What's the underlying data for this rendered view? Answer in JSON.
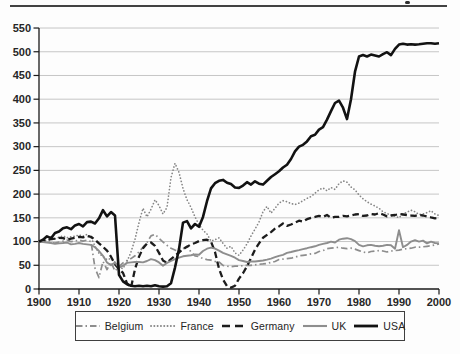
{
  "figure": {
    "page_top_rule": true,
    "header_remnant_mark": true
  },
  "colors": {
    "background": "#fdfdfd",
    "grid": "#c6c6c6",
    "axis": "#1a1a1a",
    "tick_text": "#262626",
    "page_rule": "#424242",
    "legend_border": "#3f3f3f",
    "series_grey": "#8d8d8d",
    "series_black": "#141414"
  },
  "chart_data": {
    "type": "line",
    "title": "",
    "xlabel": "",
    "ylabel": "",
    "xlim": [
      1900,
      2000
    ],
    "ylim": [
      0,
      550
    ],
    "x_tick_labels": [
      "1900",
      "1910",
      "1920",
      "1930",
      "1940",
      "1950",
      "1960",
      "1970",
      "1980",
      "1990",
      "2000"
    ],
    "y_tick_labels": [
      "0",
      "50",
      "100",
      "150",
      "200",
      "250",
      "300",
      "350",
      "400",
      "450",
      "500",
      "550"
    ],
    "grid": "horizontal",
    "legend_position": "bottom-box",
    "x_start_year": 1900,
    "x_step_years": 1,
    "index_base": "1900 = 100",
    "series": [
      {
        "name": "Belgium",
        "color": "#8d8d8d",
        "style": "dashdot",
        "width": 1.7,
        "values": [
          100,
          100,
          99,
          98,
          97,
          99,
          101,
          103,
          100,
          101,
          103,
          101,
          103,
          100,
          44,
          24,
          58,
          41,
          57,
          38,
          47,
          55,
          60,
          64,
          70,
          78,
          88,
          98,
          112,
          115,
          107,
          99,
          92,
          86,
          82,
          80,
          85,
          90,
          78,
          70,
          68,
          64,
          62,
          61,
          58,
          57,
          50,
          48,
          47,
          48,
          48,
          49,
          50,
          50,
          51,
          52,
          53,
          54,
          56,
          58,
          62,
          63,
          64,
          65,
          67,
          70,
          71,
          72,
          74,
          75,
          79,
          81,
          85,
          86,
          87,
          88,
          86,
          85,
          86,
          84,
          81,
          78,
          76,
          79,
          80,
          81,
          80,
          78,
          80,
          81,
          82,
          84,
          85,
          86,
          88,
          88,
          89,
          90,
          91,
          93,
          95
        ]
      },
      {
        "name": "France",
        "color": "#868686",
        "style": "dotted",
        "width": 1.7,
        "values": [
          100,
          102,
          103,
          104,
          106,
          109,
          112,
          108,
          110,
          111,
          114,
          111,
          115,
          109,
          90,
          75,
          68,
          62,
          64,
          56,
          46,
          43,
          58,
          78,
          105,
          140,
          170,
          152,
          168,
          188,
          176,
          158,
          172,
          235,
          265,
          246,
          212,
          188,
          172,
          152,
          136,
          124,
          116,
          101,
          104,
          108,
          96,
          86,
          90,
          76,
          71,
          82,
          95,
          112,
          126,
          141,
          163,
          174,
          160,
          170,
          181,
          186,
          184,
          180,
          178,
          181,
          186,
          191,
          195,
          202,
          209,
          213,
          207,
          214,
          210,
          222,
          228,
          225,
          215,
          209,
          198,
          190,
          184,
          179,
          175,
          170,
          163,
          159,
          156,
          154,
          150,
          158,
          162,
          166,
          163,
          157,
          158,
          161,
          165,
          158,
          155
        ]
      },
      {
        "name": "Germany",
        "color": "#1c1c1c",
        "style": "dashed",
        "width": 2.3,
        "values": [
          100,
          101,
          103,
          105,
          106,
          108,
          107,
          104,
          106,
          108,
          110,
          109,
          112,
          110,
          104,
          96,
          89,
          81,
          68,
          52,
          42,
          34,
          12,
          3,
          42,
          68,
          86,
          96,
          98,
          91,
          76,
          60,
          55,
          63,
          70,
          77,
          84,
          89,
          94,
          97,
          101,
          103,
          104,
          100,
          78,
          43,
          20,
          6,
          3,
          7,
          22,
          33,
          48,
          65,
          83,
          96,
          108,
          114,
          120,
          127,
          132,
          138,
          133,
          136,
          140,
          144,
          142,
          147,
          150,
          152,
          154,
          152,
          156,
          150,
          152,
          152,
          154,
          153,
          155,
          157,
          158,
          154,
          155,
          158,
          157,
          160,
          157,
          153,
          155,
          156,
          158,
          157,
          156,
          155,
          154,
          156,
          155,
          153,
          151,
          149,
          150
        ]
      },
      {
        "name": "UK",
        "color": "#8d8d8d",
        "style": "solid",
        "width": 1.9,
        "values": [
          100,
          99,
          98,
          97,
          95,
          96,
          97,
          98,
          94,
          95,
          97,
          95,
          94,
          93,
          88,
          80,
          70,
          56,
          50,
          56,
          45,
          49,
          55,
          56,
          57,
          57,
          56,
          59,
          63,
          61,
          56,
          49,
          55,
          59,
          63,
          66,
          69,
          70,
          71,
          73,
          72,
          80,
          85,
          87,
          85,
          81,
          76,
          73,
          70,
          66,
          61,
          59,
          57,
          58,
          58,
          59,
          60,
          62,
          64,
          67,
          70,
          72,
          76,
          78,
          80,
          82,
          84,
          86,
          88,
          90,
          93,
          95,
          97,
          100,
          98,
          104,
          106,
          107,
          105,
          101,
          93,
          90,
          92,
          93,
          91,
          90,
          91,
          93,
          92,
          85,
          124,
          88,
          93,
          100,
          103,
          100,
          102,
          96,
          100,
          97,
          96
        ]
      },
      {
        "name": "USA",
        "color": "#121212",
        "style": "solid",
        "width": 2.6,
        "values": [
          100,
          104,
          111,
          107,
          118,
          121,
          128,
          130,
          126,
          134,
          137,
          132,
          141,
          142,
          138,
          149,
          166,
          153,
          162,
          155,
          30,
          16,
          10,
          7,
          6,
          7,
          6,
          7,
          6,
          8,
          6,
          5,
          6,
          12,
          45,
          84,
          140,
          143,
          128,
          137,
          131,
          152,
          185,
          212,
          223,
          228,
          230,
          224,
          221,
          214,
          213,
          218,
          225,
          220,
          227,
          222,
          220,
          228,
          236,
          242,
          248,
          256,
          262,
          274,
          290,
          300,
          304,
          311,
          322,
          325,
          336,
          341,
          357,
          375,
          392,
          397,
          382,
          358,
          400,
          458,
          490,
          493,
          490,
          494,
          492,
          490,
          495,
          499,
          493,
          506,
          515,
          517,
          515,
          516,
          515,
          516,
          517,
          518,
          518,
          517,
          518
        ]
      }
    ]
  }
}
